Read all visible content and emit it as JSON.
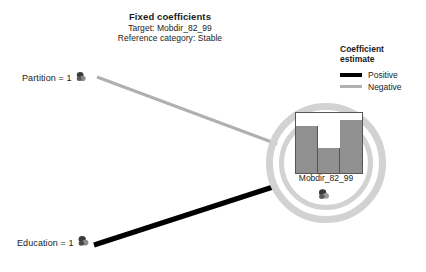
{
  "chart_data": {
    "type": "diagram",
    "diagram_kind": "fixed-coefficients-network",
    "title": "Fixed coefficients",
    "subtitle_target": "Target: Mobdir_82_99",
    "subtitle_reference": "Reference category: Stable",
    "legend": {
      "title_line1": "Coefficient",
      "title_line2": "estimate",
      "entries": [
        {
          "label": "Positive",
          "color": "#000000",
          "style": "thick-black"
        },
        {
          "label": "Negative",
          "color": "#b0b0b0",
          "style": "thin-gray"
        }
      ]
    },
    "nodes": [
      {
        "id": "partition",
        "label": "Partition = 1",
        "type": "predictor",
        "icon": "predictor-node-icon"
      },
      {
        "id": "education",
        "label": "Education = 1",
        "type": "predictor",
        "icon": "predictor-node-icon"
      },
      {
        "id": "target",
        "label": "Mobdir_82_99",
        "type": "target",
        "icon": "target-node-icon"
      }
    ],
    "edges": [
      {
        "from": "partition",
        "to": "target",
        "effect": "Negative",
        "color": "#b0b0b0",
        "width": 3
      },
      {
        "from": "education",
        "to": "target",
        "effect": "Positive",
        "color": "#000000",
        "width": 5
      }
    ],
    "target_minichart": {
      "type": "bar",
      "categories": [
        "1",
        "2",
        "3"
      ],
      "values": [
        78,
        42,
        88
      ],
      "ylim": [
        0,
        100
      ],
      "bar_color": "#909090",
      "border_color": "#555555",
      "grid": false,
      "xlabel": "",
      "ylabel": ""
    },
    "colors": {
      "background": "#ffffff",
      "text": "#1a1a1a",
      "ring": "#d2d2d2",
      "positive_edge": "#000000",
      "negative_edge": "#b0b0b0"
    }
  },
  "title_block": {
    "title": "Fixed coefficients",
    "target_line": "Target: Mobdir_82_99",
    "reference_line": "Reference category: Stable"
  },
  "legend": {
    "title_line1": "Coefficient",
    "title_line2": "estimate",
    "positive_label": "Positive",
    "negative_label": "Negative"
  },
  "nodes": {
    "partition_label": "Partition = 1",
    "education_label": "Education = 1",
    "target_label": "Mobdir_82_99"
  }
}
